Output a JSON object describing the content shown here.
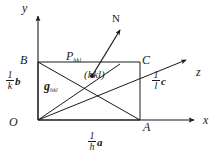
{
  "figure": {
    "type": "crystallographic-miller-index-plane-diagram",
    "background_color": "#ffffff",
    "line_color": "#1a1a1a",
    "text_color": "#1a1a1a"
  },
  "axes": {
    "y_label": "y",
    "x_label": "x",
    "z_label": "z"
  },
  "vertices": {
    "origin_label": "O",
    "a_intercept_label": "A",
    "b_intercept_label": "B",
    "c_intercept_label": "C",
    "normal_label": "N"
  },
  "labels": {
    "plane_point": "P",
    "plane_point_sub": "hkl",
    "plane_indices": "(hkl)",
    "reciprocal_vector": "g",
    "reciprocal_vector_sub": "hkl"
  },
  "intercepts": {
    "a": {
      "numerator": "1",
      "denominator": "h",
      "vector": "a"
    },
    "b": {
      "numerator": "1",
      "denominator": "k",
      "vector": "b"
    },
    "c": {
      "numerator": "1",
      "denominator": "l",
      "vector": "c"
    }
  },
  "geometry": {
    "origin": [
      38,
      120
    ],
    "point_a": [
      140,
      120
    ],
    "point_b": [
      38,
      62
    ],
    "point_c": [
      140,
      62
    ],
    "normal_arrow_tip": [
      124,
      27
    ],
    "normal_arrow_tail": [
      92,
      75
    ],
    "z_arrow_tip": [
      190,
      58
    ],
    "x_arrow_tip": [
      198,
      120
    ],
    "y_arrow_tip": [
      38,
      12
    ],
    "plane_dot": [
      92,
      75
    ]
  }
}
